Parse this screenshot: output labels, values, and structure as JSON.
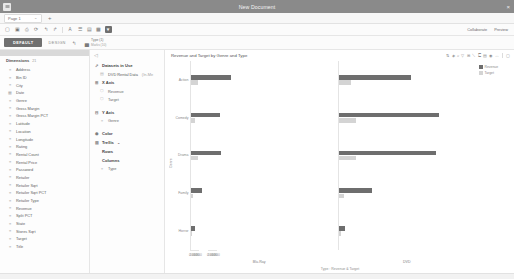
{
  "titlebar": {
    "menu_icon": "hamburger-icon",
    "title": "New Document",
    "close_icon": "×"
  },
  "tabstrip": {
    "tab_label": "Page 1",
    "tab_caret": "⌄",
    "add_label": "+"
  },
  "toolbar": {
    "icons": [
      "new-icon",
      "save-icon",
      "print-icon",
      "refresh-icon",
      "undo-icon",
      "redo-icon",
      "font-icon",
      "list-icon",
      "table-icon",
      "grid-icon"
    ],
    "filter_icon": "filter-icon",
    "collaborate_label": "Collaborate",
    "preview_label": "Preview"
  },
  "modebar": {
    "default_label": "DEFAULT",
    "design_label": "DESIGN",
    "pointer_icon": "pointer-icon",
    "viz_icon": "bar-chart-icon",
    "viz_type_label": "Type (1)",
    "viz_marks_label": "Marks (10)"
  },
  "dimensions": {
    "title": "Dimensions",
    "count": "21",
    "items": [
      {
        "glyph": "≡",
        "label": "Address"
      },
      {
        "glyph": "≡",
        "label": "Bin ID"
      },
      {
        "glyph": "≡",
        "label": "City"
      },
      {
        "glyph": "▦",
        "label": "Date"
      },
      {
        "glyph": "≡",
        "label": "Genre"
      },
      {
        "glyph": "≡",
        "label": "Gross Margin"
      },
      {
        "glyph": "≡",
        "label": "Gross Margin PCT"
      },
      {
        "glyph": "≡",
        "label": "Latitude"
      },
      {
        "glyph": "≡",
        "label": "Location"
      },
      {
        "glyph": "≡",
        "label": "Longitude"
      },
      {
        "glyph": "≡",
        "label": "Rating"
      },
      {
        "glyph": "≡",
        "label": "Rental Count"
      },
      {
        "glyph": "≡",
        "label": "Rental Price"
      },
      {
        "glyph": "≡",
        "label": "Password"
      },
      {
        "glyph": "≡",
        "label": "Retailer"
      },
      {
        "glyph": "≡",
        "label": "Retailer Sqrt"
      },
      {
        "glyph": "≡",
        "label": "Retailer Sqrt PCT"
      },
      {
        "glyph": "≡",
        "label": "Retailer Type"
      },
      {
        "glyph": "≡",
        "label": "Revenue"
      },
      {
        "glyph": "≡",
        "label": "Split PCT"
      },
      {
        "glyph": "≡",
        "label": "State"
      },
      {
        "glyph": "≡",
        "label": "Stores Sqrt"
      },
      {
        "glyph": "≡",
        "label": "Target"
      },
      {
        "glyph": "≡",
        "label": "Title"
      }
    ]
  },
  "shelf": {
    "collapse_icon": "◁",
    "datasets": {
      "icon": "link-icon",
      "title": "Datasets in Use",
      "item_icon": "database-icon",
      "item_label": "DVD Rental Data",
      "item_dim": "(In-Me"
    },
    "x_axis": {
      "icon": "axis-x-icon",
      "title": "X Axis",
      "fields": [
        {
          "glyph": "⬡",
          "label": "Revenue"
        },
        {
          "glyph": "⬡",
          "label": "Target"
        }
      ]
    },
    "y_axis": {
      "icon": "axis-y-icon",
      "title": "Y Axis",
      "fields": [
        {
          "glyph": "≡",
          "label": "Genre"
        }
      ]
    },
    "color": {
      "icon": "palette-icon",
      "title": "Color",
      "fields": []
    },
    "trellis": {
      "icon": "trellis-icon",
      "title": "Trellis",
      "more": "⌄",
      "fields": []
    },
    "rows": {
      "title": "Rows",
      "fields": []
    },
    "columns": {
      "title": "Columns",
      "fields": [
        {
          "glyph": "≡",
          "label": "Type"
        }
      ]
    }
  },
  "chart_data": {
    "type": "bar",
    "title": "Revenue and Target by Genre and Type",
    "xlabel": "Type : Revenue & Target",
    "ylabel": "Genre",
    "xlim": [
      0,
      800
    ],
    "xticks": [
      0,
      200,
      400,
      600,
      800
    ],
    "xtick_labels": [
      "0",
      "200",
      "400",
      "600",
      "800"
    ],
    "grid": false,
    "legend_position": "right",
    "legend": [
      {
        "name": "Revenue",
        "color": "#6e6e6e"
      },
      {
        "name": "Target",
        "color": "#d4d4d4"
      }
    ],
    "categories": [
      "Action",
      "Comedy",
      "Drama",
      "Family",
      "Horror"
    ],
    "panels": [
      {
        "name": "Blu-Ray",
        "series": [
          {
            "name": "Revenue",
            "values": [
              230,
              170,
              175,
              65,
              25
            ]
          },
          {
            "name": "Target",
            "values": [
              38,
              22,
              42,
              12,
              8
            ]
          }
        ]
      },
      {
        "name": "DVD",
        "series": [
          {
            "name": "Revenue",
            "values": [
              420,
              585,
              565,
              195,
              35
            ]
          },
          {
            "name": "Target",
            "values": [
              75,
              100,
              100,
              30,
              12
            ]
          }
        ]
      }
    ]
  },
  "chart_toolbar": {
    "icons": [
      "sort-icon",
      "marker-icon",
      "zoom-icon",
      "filter-icon",
      "grid-icon",
      "line-icon",
      "label-icon",
      "legend-icon",
      "settings-icon",
      "expand-icon",
      "maximize-icon"
    ]
  }
}
